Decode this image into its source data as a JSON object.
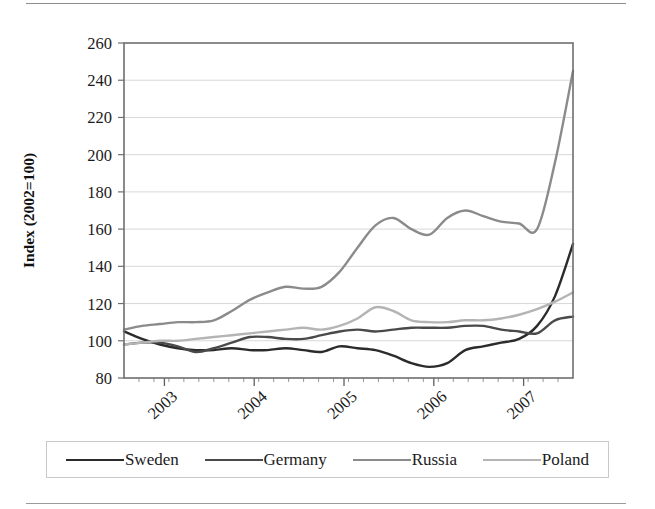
{
  "chart_data": {
    "type": "line",
    "title": "",
    "xlabel": "",
    "ylabel": "Index (2002=100)",
    "ylim": [
      80,
      260
    ],
    "ytick_step": 20,
    "yticks": [
      "80",
      "100",
      "120",
      "140",
      "160",
      "180",
      "200",
      "220",
      "240",
      "260"
    ],
    "xticks": [
      "2003",
      "2004",
      "2005",
      "2006",
      "2007"
    ],
    "xlim": [
      "2002-10",
      "2006-12"
    ],
    "grid": "horizontal",
    "legend_position": "bottom",
    "minor_xticks_per_year": 6,
    "x": [
      "2002-10",
      "2002-12",
      "2003-02",
      "2003-04",
      "2003-06",
      "2003-08",
      "2003-10",
      "2003-12",
      "2004-02",
      "2004-04",
      "2004-06",
      "2004-08",
      "2004-10",
      "2004-12",
      "2005-02",
      "2005-04",
      "2005-06",
      "2005-08",
      "2005-10",
      "2005-12",
      "2006-02",
      "2006-04",
      "2006-06",
      "2006-08",
      "2006-10",
      "2006-12"
    ],
    "series": [
      {
        "name": "Sweden",
        "color": "#2b2b2b",
        "values": [
          105,
          101,
          98,
          96,
          95,
          95,
          96,
          95,
          95,
          96,
          95,
          94,
          97,
          96,
          95,
          92,
          88,
          86,
          88,
          95,
          97,
          99,
          101,
          108,
          124,
          152
        ]
      },
      {
        "name": "Germany",
        "color": "#4a4a4a",
        "values": [
          98,
          99,
          99,
          97,
          94,
          96,
          99,
          102,
          102,
          101,
          101,
          103,
          105,
          106,
          105,
          106,
          107,
          107,
          107,
          108,
          108,
          106,
          105,
          104,
          111,
          113
        ]
      },
      {
        "name": "Russia",
        "color": "#8b8b8b",
        "values": [
          106,
          108,
          109,
          110,
          110,
          111,
          116,
          122,
          126,
          129,
          128,
          129,
          137,
          150,
          162,
          166,
          160,
          157,
          166,
          170,
          167,
          164,
          163,
          160,
          196,
          245
        ]
      },
      {
        "name": "Poland",
        "color": "#b4b4b4",
        "values": [
          98,
          99,
          100,
          100,
          101,
          102,
          103,
          104,
          105,
          106,
          107,
          106,
          108,
          112,
          118,
          116,
          111,
          110,
          110,
          111,
          111,
          112,
          114,
          117,
          121,
          126
        ]
      }
    ]
  },
  "legend": {
    "items": [
      {
        "label": "Sweden",
        "color": "#2b2b2b"
      },
      {
        "label": "Germany",
        "color": "#4a4a4a"
      },
      {
        "label": "Russia",
        "color": "#8b8b8b"
      },
      {
        "label": "Poland",
        "color": "#b4b4b4"
      }
    ]
  },
  "style": {
    "frame_color": "#6f6f6f",
    "grid_color": "#d8d8d8",
    "rule_color": "#8d8d8d"
  }
}
